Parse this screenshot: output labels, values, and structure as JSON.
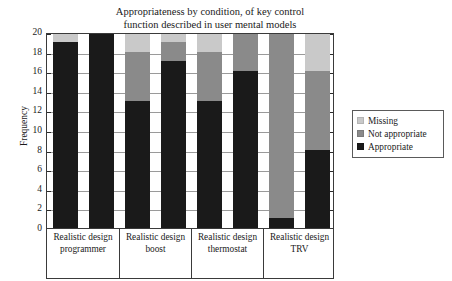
{
  "chart_data": {
    "type": "bar",
    "title": "Appropriateness by condition, of key control\nfunction described in user mental models",
    "xlabel": "",
    "ylabel": "Frequency",
    "ylim": [
      0,
      20
    ],
    "ytick_step": 2,
    "yticks": [
      0,
      2,
      4,
      6,
      8,
      10,
      12,
      14,
      16,
      18,
      20
    ],
    "grid": true,
    "stacked": true,
    "legend_position": "right",
    "bars_per_group": 2,
    "groups": [
      {
        "label": "Realistic design\nprogrammer",
        "line1": "Realistic design",
        "line2": "programmer"
      },
      {
        "label": "Realistic design\nboost",
        "line1": "Realistic design",
        "line2": "boost"
      },
      {
        "label": "Realistic design\nthermostat",
        "line1": "Realistic design",
        "line2": "thermostat"
      },
      {
        "label": "Realistic design\nTRV",
        "line1": "Realistic design",
        "line2": "TRV"
      }
    ],
    "series": [
      {
        "name": "Appropriate",
        "color": "#1a1a1a",
        "values": [
          19,
          20,
          13,
          17,
          13,
          16,
          1,
          8
        ]
      },
      {
        "name": "Not appropriate",
        "color": "#8a8a8a",
        "values": [
          0,
          0,
          5,
          2,
          5,
          4,
          19,
          8
        ]
      },
      {
        "name": "Missing",
        "color": "#c9c9c9",
        "values": [
          1,
          0,
          2,
          1,
          2,
          0,
          0,
          4
        ]
      }
    ],
    "bars": [
      {
        "group": "Realistic design programmer",
        "index": 0,
        "appropriate": 19,
        "not_appropriate": 0,
        "missing": 1,
        "total": 20
      },
      {
        "group": "Realistic design programmer",
        "index": 1,
        "appropriate": 20,
        "not_appropriate": 0,
        "missing": 0,
        "total": 20
      },
      {
        "group": "Realistic design boost",
        "index": 0,
        "appropriate": 13,
        "not_appropriate": 5,
        "missing": 2,
        "total": 20
      },
      {
        "group": "Realistic design boost",
        "index": 1,
        "appropriate": 17,
        "not_appropriate": 2,
        "missing": 1,
        "total": 20
      },
      {
        "group": "Realistic design thermostat",
        "index": 0,
        "appropriate": 13,
        "not_appropriate": 5,
        "missing": 2,
        "total": 20
      },
      {
        "group": "Realistic design thermostat",
        "index": 1,
        "appropriate": 16,
        "not_appropriate": 4,
        "missing": 0,
        "total": 20
      },
      {
        "group": "Realistic design TRV",
        "index": 0,
        "appropriate": 1,
        "not_appropriate": 19,
        "missing": 0,
        "total": 20
      },
      {
        "group": "Realistic design TRV",
        "index": 1,
        "appropriate": 8,
        "not_appropriate": 8,
        "missing": 4,
        "total": 20
      }
    ],
    "legend": [
      {
        "label": "Missing",
        "color": "#c9c9c9"
      },
      {
        "label": "Not appropriate",
        "color": "#8a8a8a"
      },
      {
        "label": "Appropriate",
        "color": "#1a1a1a"
      }
    ]
  }
}
